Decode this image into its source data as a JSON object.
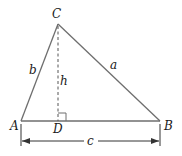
{
  "diagram": {
    "type": "triangle-with-altitude",
    "vertices": {
      "A": {
        "label": "A",
        "x": 21,
        "y": 121
      },
      "B": {
        "label": "B",
        "x": 160,
        "y": 121
      },
      "C": {
        "label": "C",
        "x": 58,
        "y": 24
      },
      "D": {
        "label": "D",
        "x": 58,
        "y": 121
      }
    },
    "sides": {
      "a": {
        "label": "a",
        "from": "C",
        "to": "B"
      },
      "b": {
        "label": "b",
        "from": "A",
        "to": "C"
      },
      "c": {
        "label": "c",
        "from": "A",
        "to": "B"
      }
    },
    "altitude": {
      "label": "h",
      "from": "C",
      "to": "D",
      "style": "dashed"
    },
    "right_angle_marker": {
      "at": "D",
      "size": 8
    },
    "dimension": {
      "label": "c",
      "y": 141,
      "from_x": 21,
      "to_x": 160
    },
    "colors": {
      "stroke": "#6e6e6e",
      "text": "#1a1a1a"
    }
  }
}
